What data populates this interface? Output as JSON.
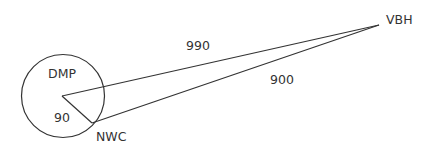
{
  "diagram": {
    "nodes": {
      "dmp": {
        "label": "DMP"
      },
      "nwc": {
        "label": "NWC"
      },
      "vbh": {
        "label": "VBH"
      }
    },
    "edges": {
      "dmp_vbh": {
        "label": "990"
      },
      "nwc_vbh": {
        "label": "900"
      },
      "dmp_nwc": {
        "label": "90"
      }
    },
    "colors": {
      "stroke": "#333333",
      "text": "#333333",
      "background": "#ffffff"
    }
  }
}
